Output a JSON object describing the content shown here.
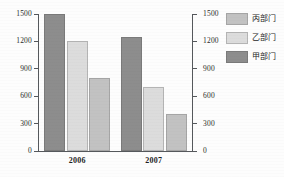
{
  "chart_data": {
    "type": "bar",
    "title": "",
    "subtitle": "",
    "xlabel": "",
    "ylabel": "",
    "categories": [
      "2006",
      "2007"
    ],
    "series": [
      {
        "name": "甲部门",
        "values": [
          1500,
          1250
        ],
        "color": "#8d8d8d"
      },
      {
        "name": "乙部门",
        "values": [
          1200,
          700
        ],
        "color": "#dcdcdc"
      },
      {
        "name": "丙部门",
        "values": [
          800,
          400
        ],
        "color": "#c2c2c2"
      }
    ],
    "ylim": [
      0,
      1500
    ],
    "y_ticks": [
      0,
      300,
      600,
      900,
      1200,
      1500
    ],
    "y_tick_labels": [
      "0",
      "300",
      "600",
      "900",
      "1200",
      "1500"
    ],
    "secondary_axis": {
      "position": "right",
      "ylim": [
        0,
        1500
      ],
      "y_ticks": [
        0,
        300,
        600,
        900,
        1200,
        1500
      ],
      "y_tick_labels": [
        "0",
        "300",
        "600",
        "900",
        "1200",
        "1500"
      ]
    },
    "grid": false,
    "legend": {
      "position": "right",
      "entries": [
        {
          "label": "丙部门",
          "color": "#c2c2c2"
        },
        {
          "label": "乙部门",
          "color": "#dcdcdc"
        },
        {
          "label": "甲部门",
          "color": "#8d8d8d"
        }
      ]
    },
    "bar_order_in_group": [
      "甲部门",
      "乙部门",
      "丙部门"
    ]
  }
}
